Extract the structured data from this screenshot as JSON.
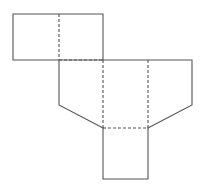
{
  "diagram": {
    "type": "net",
    "colors": {
      "line": "#555555",
      "background": "#ffffff"
    },
    "solid_edges": [
      {
        "id": "top-rect",
        "points": [
          [
            13,
            14
          ],
          [
            103,
            14
          ],
          [
            103,
            60
          ],
          [
            13,
            60
          ],
          [
            13,
            14
          ]
        ]
      },
      {
        "id": "left-wall",
        "points": [
          [
            59,
            60
          ],
          [
            59,
            105
          ],
          [
            103,
            128
          ]
        ]
      },
      {
        "id": "right-wall",
        "points": [
          [
            103,
            60
          ],
          [
            192,
            60
          ],
          [
            192,
            105
          ],
          [
            148,
            128
          ]
        ]
      },
      {
        "id": "bottom-square",
        "points": [
          [
            103,
            128
          ],
          [
            103,
            179
          ],
          [
            148,
            179
          ],
          [
            148,
            128
          ]
        ]
      }
    ],
    "fold_lines": [
      {
        "id": "fold-top-mid",
        "points": [
          [
            59,
            14
          ],
          [
            59,
            60
          ]
        ]
      },
      {
        "id": "fold-top-bottom",
        "points": [
          [
            59,
            60
          ],
          [
            103,
            60
          ]
        ]
      },
      {
        "id": "fold-mid-left",
        "points": [
          [
            103,
            60
          ],
          [
            103,
            128
          ]
        ]
      },
      {
        "id": "fold-mid-right",
        "points": [
          [
            148,
            60
          ],
          [
            148,
            128
          ]
        ]
      },
      {
        "id": "fold-bottom-top",
        "points": [
          [
            103,
            128
          ],
          [
            148,
            128
          ]
        ]
      }
    ]
  }
}
